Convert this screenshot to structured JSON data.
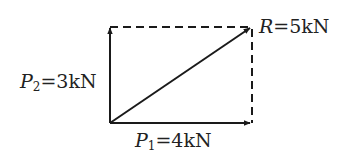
{
  "diagram": {
    "colors": {
      "stroke": "#1a1a1a",
      "text": "#222222",
      "background": "#ffffff"
    },
    "forces": {
      "P1": {
        "symbol": "P",
        "subscript": "1",
        "equals": "=4kN",
        "value": 4,
        "unit": "kN",
        "direction": "horizontal"
      },
      "P2": {
        "symbol": "P",
        "subscript": "2",
        "equals": "=3kN",
        "value": 3,
        "unit": "kN",
        "direction": "vertical"
      },
      "R": {
        "symbol": "R",
        "equals": "=5kN",
        "value": 5,
        "unit": "kN",
        "direction": "diagonal"
      }
    }
  }
}
